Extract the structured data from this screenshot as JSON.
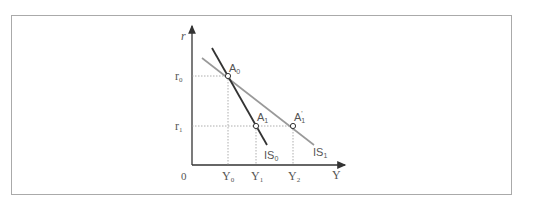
{
  "header_clipped_text": "",
  "diagram": {
    "type": "IS curve shift diagram",
    "axes": {
      "y_label": "r",
      "x_label": "Y",
      "origin_label": "0"
    },
    "y_ticks": [
      {
        "label": "r",
        "sub": "0"
      },
      {
        "label": "r",
        "sub": "1"
      }
    ],
    "x_ticks": [
      {
        "label": "Y",
        "sub": "0"
      },
      {
        "label": "Y",
        "sub": "1"
      },
      {
        "label": "Y",
        "sub": "2"
      }
    ],
    "curves": [
      {
        "label": "IS",
        "sub": "0",
        "color": "#333333"
      },
      {
        "label": "IS",
        "sub": "1",
        "color": "#999999"
      }
    ],
    "points": [
      {
        "label": "A",
        "sub": "0"
      },
      {
        "label": "A",
        "sub": "1"
      },
      {
        "label": "A",
        "sub": "1",
        "prime": "'"
      }
    ]
  }
}
